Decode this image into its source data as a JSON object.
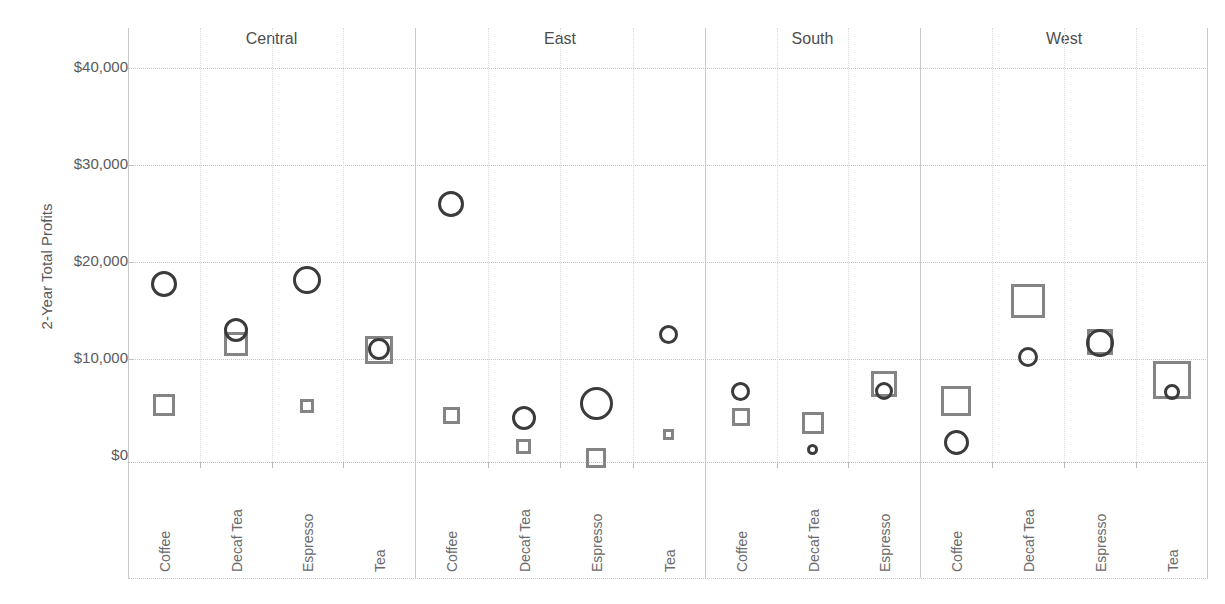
{
  "chart_data": {
    "type": "scatter",
    "title": "",
    "xlabel": "",
    "ylabel": "2-Year Total Profits",
    "ylim": [
      -2000,
      42000
    ],
    "y_ticks": [
      0,
      10000,
      20000,
      30000,
      40000
    ],
    "y_tick_labels": [
      "$0",
      "$10,000",
      "$20,000",
      "$30,000",
      "$40,000"
    ],
    "grid": true,
    "legend_position": "none",
    "panel_variable": "Region",
    "panels": [
      "Central",
      "East",
      "South",
      "West"
    ],
    "category_variable": "Product",
    "series": [
      {
        "name": "Profit (circle)",
        "marker": "circle",
        "color": "#3b3b3b"
      },
      {
        "name": "Sales-size (square)",
        "marker": "square",
        "color": "#848484"
      }
    ],
    "points": [
      {
        "region": "Central",
        "product": "Coffee",
        "circle": 17700,
        "circle_size": 26,
        "square": 5300,
        "square_size": 22
      },
      {
        "region": "Central",
        "product": "Decaf Tea",
        "circle": 13000,
        "circle_size": 24,
        "square": 11500,
        "square_size": 24
      },
      {
        "region": "Central",
        "product": "Espresso",
        "circle": 18100,
        "circle_size": 28,
        "square": 5200,
        "square_size": 14
      },
      {
        "region": "Central",
        "product": "Tea",
        "circle": 11000,
        "circle_size": 22,
        "square": 10900,
        "square_size": 28
      },
      {
        "region": "East",
        "product": "Coffee",
        "circle": 26000,
        "circle_size": 26,
        "square": 4200,
        "square_size": 17
      },
      {
        "region": "East",
        "product": "Decaf Tea",
        "circle": 3900,
        "circle_size": 24,
        "square": 1000,
        "square_size": 15
      },
      {
        "region": "East",
        "product": "Espresso",
        "circle": 5400,
        "circle_size": 33,
        "square": -200,
        "square_size": 20
      },
      {
        "region": "East",
        "product": "Tea",
        "circle": 12500,
        "circle_size": 19,
        "square": 2200,
        "square_size": 11
      },
      {
        "region": "South",
        "product": "Coffee",
        "circle": 6700,
        "circle_size": 19,
        "square": 4000,
        "square_size": 18
      },
      {
        "region": "South",
        "product": "Decaf Tea",
        "circle": 700,
        "circle_size": 11,
        "square": 3400,
        "square_size": 22
      },
      {
        "region": "South",
        "product": "Espresso",
        "circle": 6700,
        "circle_size": 18,
        "square": 7400,
        "square_size": 26
      },
      {
        "region": "West",
        "product": "Coffee",
        "circle": 1400,
        "circle_size": 25,
        "square": 5700,
        "square_size": 30
      },
      {
        "region": "West",
        "product": "Decaf Tea",
        "circle": 10200,
        "circle_size": 20,
        "square": 16000,
        "square_size": 34
      },
      {
        "region": "West",
        "product": "Espresso",
        "circle": 11600,
        "circle_size": 28,
        "square": 11800,
        "square_size": 26
      },
      {
        "region": "West",
        "product": "Tea",
        "circle": 6600,
        "circle_size": 16,
        "square": 7800,
        "square_size": 38
      }
    ]
  },
  "axis": {
    "y_title": "2-Year Total Profits",
    "y_tick_labels": [
      "$40,000",
      "$30,000",
      "$20,000",
      "$10,000",
      "$0"
    ]
  },
  "regions": [
    {
      "label": "Central",
      "products": [
        "Coffee",
        "Decaf Tea",
        "Espresso",
        "Tea"
      ]
    },
    {
      "label": "East",
      "products": [
        "Coffee",
        "Decaf Tea",
        "Espresso",
        "Tea"
      ]
    },
    {
      "label": "South",
      "products": [
        "Coffee",
        "Decaf Tea",
        "Espresso"
      ]
    },
    {
      "label": "West",
      "products": [
        "Coffee",
        "Decaf Tea",
        "Espresso",
        "Tea"
      ]
    }
  ],
  "colors": {
    "circle": "#3b3b3b",
    "square": "#848484",
    "grid": "#c4c4c4",
    "text": "#5a5a5a"
  }
}
